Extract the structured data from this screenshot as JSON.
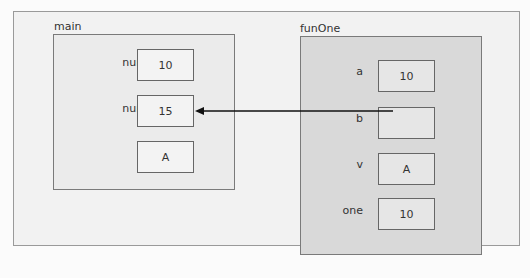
{
  "main": {
    "title": "main",
    "vars": [
      {
        "name": "num1",
        "value": "10"
      },
      {
        "name": "num2",
        "value": "15"
      },
      {
        "name": "ch",
        "value": "A"
      }
    ]
  },
  "funOne": {
    "title": "funOne",
    "vars": [
      {
        "name": "a",
        "value": "10"
      },
      {
        "name": "b",
        "value": ""
      },
      {
        "name": "v",
        "value": "A"
      },
      {
        "name": "one",
        "value": "10"
      }
    ]
  },
  "reference": {
    "from": "funOne.b",
    "to": "main.num2"
  }
}
